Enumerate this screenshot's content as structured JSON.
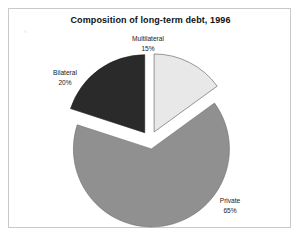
{
  "figure": {
    "title": "Composition of long-term debt, 1996",
    "background_color": "#ffffff",
    "frame_color": "#c9c9c9"
  },
  "chart_data": {
    "type": "pie",
    "title": "Composition of long-term debt, 1996",
    "xlabel": "",
    "ylabel": "",
    "units": "percent",
    "start_angle_deg": 0,
    "direction": "clockwise",
    "exploded": true,
    "legend": "none",
    "labels_position": "outside",
    "categories": [
      "Multilateral",
      "Private",
      "Bilateral"
    ],
    "values": [
      15,
      65,
      20
    ],
    "slices": [
      {
        "name": "Multilateral",
        "value": 15,
        "value_label": "15%",
        "color": "#e8e8e8",
        "start_angle_deg": 0,
        "end_angle_deg": 54,
        "exploded": true
      },
      {
        "name": "Private",
        "value": 65,
        "value_label": "65%",
        "color": "#909090",
        "start_angle_deg": 54,
        "end_angle_deg": 288,
        "exploded": true
      },
      {
        "name": "Bilateral",
        "value": 20,
        "value_label": "20%",
        "color": "#2a2a2a",
        "start_angle_deg": 288,
        "end_angle_deg": 360,
        "exploded": true
      }
    ]
  },
  "labels": {
    "multilateral": {
      "name": "Multilateral",
      "percent": "15%"
    },
    "bilateral": {
      "name": "Bilateral",
      "percent": "20%"
    },
    "private": {
      "name": "Private",
      "percent": "65%"
    }
  }
}
